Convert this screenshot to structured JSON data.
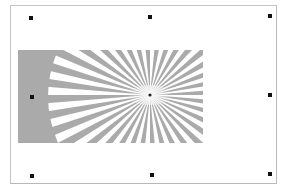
{
  "canvas": {
    "background": "#ffffff",
    "frame_border_color": "#c4c4c4"
  },
  "image": {
    "subject": "siemens-star-test-pattern",
    "fill_color": "#aaaaaa",
    "ray_color": "#ffffff",
    "ray_count": 36,
    "center_marker": "dot",
    "selected": true
  },
  "selection": {
    "handle_color": "#111111",
    "handles": [
      {
        "position": "top-left"
      },
      {
        "position": "top-center"
      },
      {
        "position": "top-right"
      },
      {
        "position": "middle-left"
      },
      {
        "position": "middle-right"
      },
      {
        "position": "bottom-left"
      },
      {
        "position": "bottom-center"
      },
      {
        "position": "bottom-right"
      }
    ]
  }
}
